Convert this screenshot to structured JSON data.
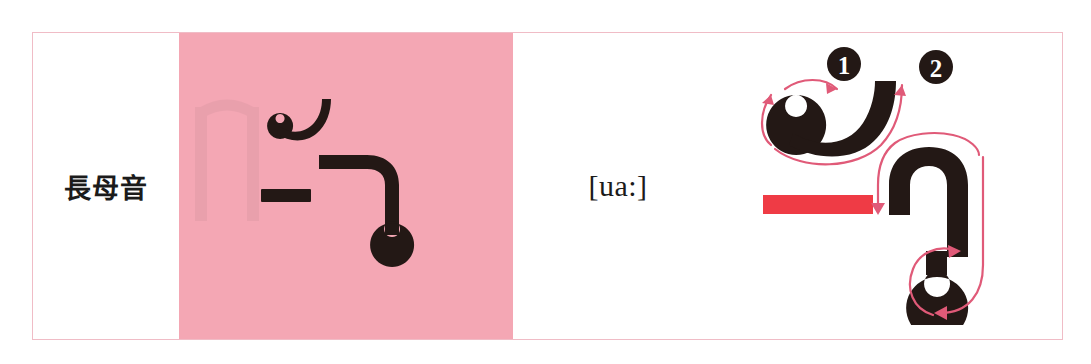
{
  "page": {
    "background_color": "#ffffff",
    "width": 1091,
    "height": 364
  },
  "table": {
    "border_color": "#f0bcc6",
    "highlight_color": "#f4a7b4",
    "ink_color": "#231815",
    "guide_color": "#e05a78",
    "red_bar_color": "#ef3b45",
    "row": {
      "label": "長母音",
      "glyph_cell": {
        "character_name": "burmese-vowel-ua-long",
        "background_color": "#f4a7b4"
      },
      "ipa": "[ua:]",
      "stroke_order": {
        "strokes": [
          {
            "number": "1",
            "name": "stroke-1-loop-hook"
          },
          {
            "number": "2",
            "name": "stroke-2-hook-loop"
          }
        ],
        "red_bar_label": "red-underbar-mark"
      }
    }
  }
}
